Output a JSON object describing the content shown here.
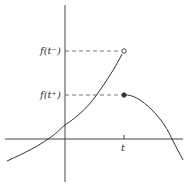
{
  "diagram": {
    "type": "piecewise-function-jump-discontinuity",
    "labels": {
      "left_limit": "f(t⁻)",
      "right_limit": "f(t⁺)",
      "x_tick": "t"
    },
    "points": {
      "left_limit_marker": "open-circle",
      "right_limit_marker": "filled-circle"
    },
    "colors": {
      "curve": "#333333",
      "axis": "#444444",
      "dashed": "#555555"
    }
  }
}
